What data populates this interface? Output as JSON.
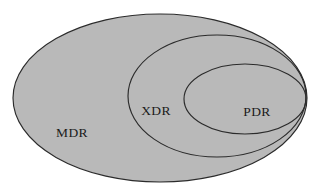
{
  "diagram": {
    "type": "nested-ellipse-venn",
    "background_color": "#ffffff",
    "fill_color": "#b9b9b9",
    "outline_color": "#2b2b2b",
    "label_color": "#1b1b1b",
    "sets": [
      {
        "id": "mdr",
        "label": "MDR",
        "label_x": 72,
        "label_y": 134,
        "cx": 160,
        "cy": 98,
        "rx": 147,
        "ry": 84
      },
      {
        "id": "xdr",
        "label": "XDR",
        "label_x": 156,
        "label_y": 112,
        "cx": 217,
        "cy": 96,
        "rx": 89,
        "ry": 61
      },
      {
        "id": "pdr",
        "label": "PDR",
        "label_x": 257,
        "label_y": 113,
        "cx": 245,
        "cy": 99,
        "rx": 61,
        "ry": 35
      }
    ]
  }
}
